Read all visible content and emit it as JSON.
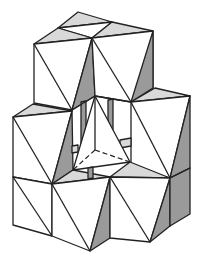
{
  "figure": {
    "title": "",
    "colors": {
      "stroke": "#222222",
      "face_white": "#ffffff",
      "face_light": "#d9d9d9",
      "face_dark": "#9a9a9a",
      "background": "#ffffff"
    },
    "parts": [
      "top-left-upper-cube",
      "top-right-upper-cube",
      "right-middle-cube",
      "left-middle-cube",
      "central-tetrahedron",
      "bottom-left-cube",
      "bottom-center-cube",
      "bottom-right-cube"
    ]
  }
}
